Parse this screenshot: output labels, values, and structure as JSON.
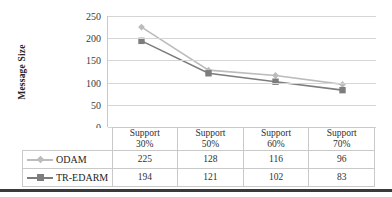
{
  "chart_data": {
    "type": "line",
    "title": "",
    "xlabel": "",
    "ylabel": "Message Size",
    "categories": [
      "Support 30%",
      "Support 50%",
      "Support 60%",
      "Support 70%"
    ],
    "category_lines": [
      {
        "line1": "Support",
        "line2": "30%"
      },
      {
        "line1": "Support",
        "line2": "50%"
      },
      {
        "line1": "Support",
        "line2": "60%"
      },
      {
        "line1": "Support",
        "line2": "70%"
      }
    ],
    "series": [
      {
        "name": "ODAM",
        "values": [
          225,
          128,
          116,
          96
        ],
        "color": "#bcbcbc",
        "marker": "diamond-marker"
      },
      {
        "name": "TR-EDARM",
        "values": [
          194,
          121,
          102,
          83
        ],
        "color": "#7d7d7d",
        "marker": "square-marker"
      }
    ],
    "ylim": [
      0,
      250
    ],
    "yticks": [
      0,
      50,
      100,
      150,
      200,
      250
    ],
    "ytick_labels": [
      "0",
      "50",
      "100",
      "150",
      "200",
      "250"
    ],
    "grid": "horizontal",
    "legend_position": "bottom-left-table",
    "has_data_table": true
  },
  "axis": {
    "y_title": "Message Size"
  },
  "colors": {
    "series_odam": "#bcbcbc",
    "series_tredarm": "#7d7d7d",
    "gridline": "#d5d5d5",
    "table_border": "#c9c9c9",
    "bottom_rule": "#3a3a3a"
  }
}
